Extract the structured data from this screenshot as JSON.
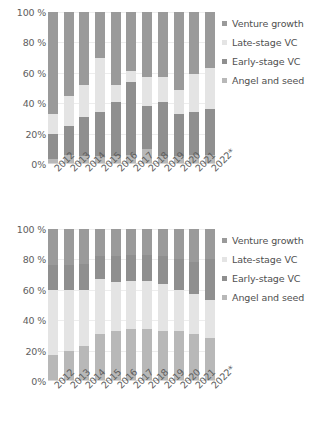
{
  "chart_data": [
    {
      "type": "bar",
      "stacked": true,
      "normalized": true,
      "title": "",
      "subtitle": "",
      "xlabel": "",
      "ylabel": "",
      "ylim": [
        0,
        100
      ],
      "yticks": [
        "0%",
        "20%",
        "40 %",
        "60 %",
        "80 %",
        "100 %"
      ],
      "ytick_values": [
        0,
        20,
        40,
        60,
        80,
        100
      ],
      "grid": true,
      "legend_position": "right",
      "categories": [
        "2012",
        "2013",
        "2014",
        "2015",
        "2016",
        "2017",
        "2018",
        "2019",
        "2020",
        "2021",
        "2022*"
      ],
      "series": [
        {
          "name": "Angel and seed",
          "color": "#b8b8b8",
          "values": [
            3,
            6,
            5,
            5,
            5,
            6,
            10,
            5,
            5,
            6,
            6
          ]
        },
        {
          "name": "Early-stage VC",
          "color": "#8f8f8f",
          "values": [
            17,
            19,
            26,
            29,
            36,
            48,
            28,
            36,
            28,
            28,
            30
          ]
        },
        {
          "name": "Late-stage VC",
          "color": "#e4e4e4",
          "values": [
            13,
            20,
            21,
            36,
            11,
            7,
            19,
            16,
            16,
            25,
            27
          ]
        },
        {
          "name": "Venture growth",
          "color": "#9a9a9a",
          "values": [
            67,
            55,
            48,
            30,
            48,
            39,
            43,
            43,
            51,
            41,
            37
          ]
        }
      ]
    },
    {
      "type": "bar",
      "stacked": true,
      "normalized": true,
      "title": "",
      "subtitle": "",
      "xlabel": "",
      "ylabel": "",
      "ylim": [
        0,
        100
      ],
      "yticks": [
        "0%",
        "20%",
        "40 %",
        "60 %",
        "80 %",
        "100 %"
      ],
      "ytick_values": [
        0,
        20,
        40,
        60,
        80,
        100
      ],
      "grid": true,
      "legend_position": "right",
      "categories": [
        "2012",
        "2013",
        "2014",
        "2015",
        "2016",
        "2017",
        "2018",
        "2019",
        "2020",
        "2021",
        "2022*"
      ],
      "series": [
        {
          "name": "Angel and seed",
          "color": "#b8b8b8",
          "values": [
            17,
            20,
            23,
            31,
            33,
            34,
            34,
            33,
            33,
            31,
            28
          ]
        },
        {
          "name": "Early-stage VC",
          "color": "#e4e4e4",
          "values": [
            43,
            40,
            37,
            36,
            32,
            32,
            32,
            31,
            27,
            26,
            25
          ]
        },
        {
          "name": "Late-stage VC",
          "color": "#8f8f8f",
          "values": [
            16,
            16,
            17,
            15,
            17,
            17,
            17,
            18,
            20,
            21,
            27
          ]
        },
        {
          "name": "Venture growth",
          "color": "#9a9a9a",
          "values": [
            24,
            24,
            23,
            18,
            18,
            17,
            17,
            18,
            20,
            22,
            20
          ]
        }
      ]
    }
  ],
  "legend": {
    "items": [
      {
        "label": "Venture growth",
        "color": "#9a9a9a"
      },
      {
        "label": "Late-stage VC",
        "color": "#e4e4e4"
      },
      {
        "label": "Early-stage VC",
        "color": "#8f8f8f"
      },
      {
        "label": "Angel and seed",
        "color": "#b8b8b8"
      }
    ]
  }
}
